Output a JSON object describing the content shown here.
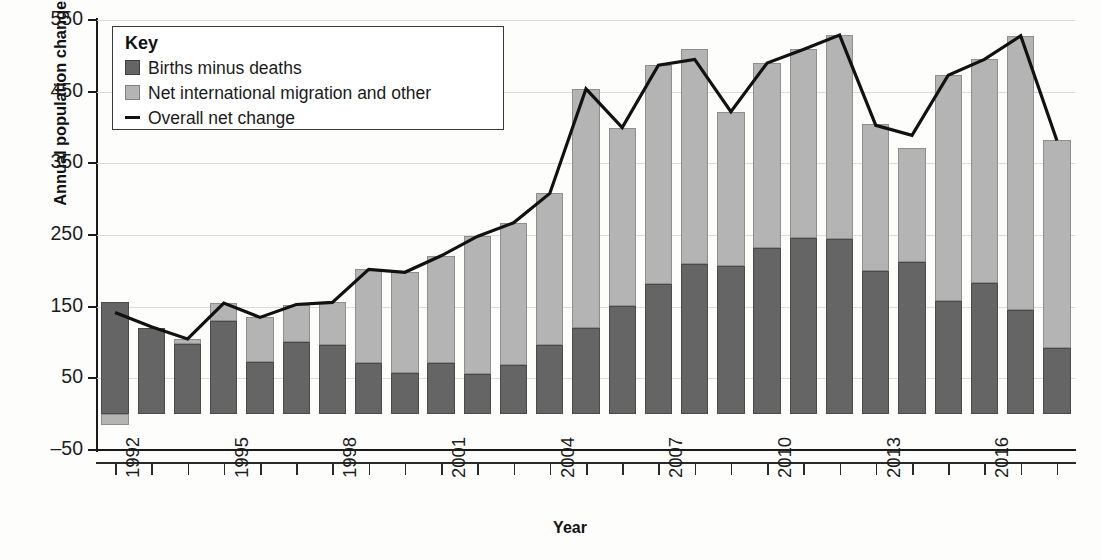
{
  "chart_data": {
    "type": "bar",
    "stacked": true,
    "title": "",
    "xlabel": "Year",
    "ylabel": "Annual population change (thousands)",
    "ylim": [
      -50,
      550
    ],
    "ytick_step": 100,
    "yticks": [
      -50,
      50,
      150,
      250,
      350,
      450,
      550
    ],
    "ytick_labels": [
      "–50",
      "50",
      "150",
      "250",
      "350",
      "450",
      "550"
    ],
    "grid": true,
    "legend_position": "top-left",
    "legend_title": "Key",
    "x": [
      1992,
      1993,
      1994,
      1995,
      1996,
      1997,
      1998,
      1999,
      2000,
      2001,
      2002,
      2003,
      2004,
      2005,
      2006,
      2007,
      2008,
      2009,
      2010,
      2011,
      2012,
      2013,
      2014,
      2015,
      2016,
      2017,
      2018
    ],
    "xtick_labels_shown": [
      "1992",
      "1995",
      "1998",
      "2001",
      "2004",
      "2007",
      "2010",
      "2013",
      "2016"
    ],
    "series": [
      {
        "name": "Births minus deaths",
        "color": "#656565",
        "values": [
          157,
          120,
          98,
          130,
          73,
          101,
          97,
          72,
          58,
          71,
          56,
          69,
          96,
          120,
          151,
          182,
          210,
          207,
          232,
          246,
          244,
          200,
          213,
          158,
          183,
          146,
          92
        ]
      },
      {
        "name": "Net international migration and other",
        "color": "#b4b4b4",
        "values": [
          -15,
          0,
          7,
          25,
          62,
          52,
          59,
          130,
          140,
          150,
          192,
          198,
          212,
          334,
          249,
          305,
          300,
          215,
          258,
          263,
          285,
          205,
          158,
          315,
          312,
          382,
          290
        ]
      }
    ],
    "line_series": {
      "name": "Overall net change",
      "color": "#111111",
      "values": [
        142,
        122,
        105,
        155,
        135,
        153,
        156,
        202,
        198,
        221,
        248,
        267,
        308,
        454,
        400,
        487,
        495,
        422,
        490,
        509,
        529,
        403,
        389,
        473,
        495,
        528,
        382
      ]
    }
  },
  "legend": {
    "title": "Key",
    "items": [
      {
        "label": "Births minus deaths",
        "swatch": "dark-square-icon"
      },
      {
        "label": "Net international migration and other",
        "swatch": "light-square-icon"
      },
      {
        "label": "Overall net change",
        "swatch": "line-icon"
      }
    ]
  },
  "axes": {
    "y_title": "Annual population change (thousands)",
    "x_title": "Year"
  },
  "caption": ""
}
